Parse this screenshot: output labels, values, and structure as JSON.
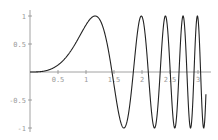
{
  "chart_data": {
    "type": "line",
    "title": "",
    "xlabel": "",
    "ylabel": "",
    "function": "sin(x^3)",
    "xlim": [
      0,
      3.14159
    ],
    "ylim": [
      -1,
      1
    ],
    "grid": false,
    "legend": null,
    "x_ticks": [
      0.5,
      1,
      1.5,
      2,
      2.5,
      3
    ],
    "x_tick_labels": [
      "0.5",
      "1",
      "1.5",
      "2",
      "2.5",
      "3"
    ],
    "y_ticks": [
      1,
      0.5,
      -0.5,
      -1
    ],
    "y_tick_labels": [
      "1",
      "0.5",
      "-0.5",
      "-1"
    ],
    "series": [
      {
        "name": "sin(x^3)",
        "color": "#222222",
        "x": [
          0,
          0.25,
          0.5,
          0.75,
          1.0,
          1.1625,
          1.25,
          1.4646,
          1.5,
          1.6765,
          1.75,
          1.8453,
          2.0,
          2.0077,
          2.1189,
          2.25,
          2.337,
          2.4175,
          2.5,
          2.5882,
          2.6709,
          2.75,
          2.8289,
          2.9044,
          3.0,
          3.0459,
          3.1,
          3.14159
        ],
        "y": [
          0,
          0.0156,
          0.1246,
          0.4053,
          0.8415,
          1.0,
          0.9577,
          0.0,
          -0.2272,
          -1.0,
          -0.8013,
          0.0,
          0.9894,
          1.0,
          0.0,
          -0.9984,
          0.0,
          1.0,
          0.2017,
          -1.0,
          0.0,
          1.0,
          -0.0,
          -1.0,
          0.9564,
          -1.0,
          -0.2,
          -0.4041
        ]
      }
    ],
    "colors": {
      "curve": "#222222",
      "axis": "#8a8a8a",
      "labels": "#9a9a9a"
    }
  }
}
